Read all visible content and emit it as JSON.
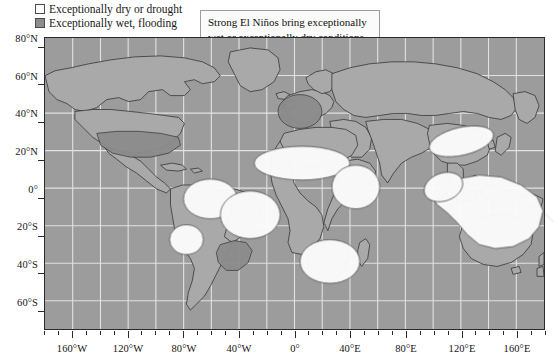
{
  "legend": {
    "items": [
      {
        "label": "Exceptionally dry or drought",
        "swatch": "dry",
        "color": "#fdfdfd",
        "icon": "legend-swatch-icon"
      },
      {
        "label": "Exceptionally wet, flooding",
        "swatch": "wet",
        "color": "#8d8d8d",
        "icon": "legend-swatch-icon"
      }
    ]
  },
  "callout": {
    "text": "Strong El Niños bring exceptionally wet or exceptionally dry conditions to a large part of the planet."
  },
  "chart_data": {
    "type": "map",
    "title": "",
    "xlabel": "",
    "ylabel": "",
    "projection": "equirectangular",
    "xlim": [
      -180,
      180
    ],
    "ylim": [
      -70,
      85
    ],
    "grid": true,
    "grid_interval_deg": 20,
    "legend_position": "top-left",
    "colors": {
      "ocean": "#9c9c9c",
      "land": "#a8a8a8",
      "coastline": "#2a2a2a",
      "gridline": "#f0f0f0",
      "dry": "#fbfbfb",
      "wet": "#8a8a8a",
      "frame": "#2b2b2b"
    },
    "x_ticks": [
      {
        "value": -160,
        "label": "160°W"
      },
      {
        "value": -120,
        "label": "120°W"
      },
      {
        "value": -80,
        "label": "80°W"
      },
      {
        "value": -40,
        "label": "40°W"
      },
      {
        "value": 0,
        "label": "0°"
      },
      {
        "value": 40,
        "label": "40°E"
      },
      {
        "value": 80,
        "label": "80°E"
      },
      {
        "value": 120,
        "label": "120°E"
      },
      {
        "value": 160,
        "label": "160°E"
      }
    ],
    "y_ticks": [
      {
        "value": 80,
        "label": "80°N"
      },
      {
        "value": 60,
        "label": "60°N"
      },
      {
        "value": 40,
        "label": "40°N"
      },
      {
        "value": 20,
        "label": "20°N"
      },
      {
        "value": 0,
        "label": "0°"
      },
      {
        "value": -20,
        "label": "20°S"
      },
      {
        "value": -40,
        "label": "40°S"
      },
      {
        "value": -60,
        "label": "60°S"
      }
    ],
    "series": [
      {
        "name": "Exceptionally dry or drought",
        "color": "#fbfbfb",
        "regions": [
          "Northern South America / Amazon basin",
          "Peru and Ecuador highlands",
          "Sahel and West Africa",
          "Horn of Africa / East Africa",
          "Southern Africa",
          "Northern China",
          "Indonesia, Philippines and northern Australia",
          "Southeast Asia"
        ]
      },
      {
        "name": "Exceptionally wet, flooding",
        "color": "#8a8a8a",
        "regions": [
          "Southern United States",
          "Western Europe",
          "Southern Brazil, Uruguay and northern Argentina",
          "Coastal Peru and Ecuador",
          "East Africa coastal strip"
        ]
      }
    ]
  }
}
